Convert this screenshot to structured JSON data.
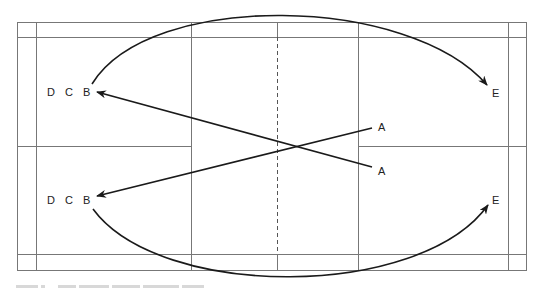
{
  "diagram": {
    "type": "badminton-court-rotation",
    "labels": {
      "top_left": [
        "D",
        "C",
        "B"
      ],
      "bottom_left": [
        "D",
        "C",
        "B"
      ],
      "right_upper": "A",
      "right_lower": "A",
      "top_right": "E",
      "bottom_right": "E"
    },
    "arrows": [
      {
        "from": "B (top-left)",
        "to": "E (top-right)",
        "shape": "curve-over-top"
      },
      {
        "from": "B (bottom-left)",
        "to": "E (bottom-right)",
        "shape": "curve-under-bottom"
      },
      {
        "from": "A (lower-right)",
        "to": "B (top-left)",
        "shape": "straight"
      },
      {
        "from": "A (upper-right)",
        "to": "B (bottom-left)",
        "shape": "straight"
      }
    ],
    "colors": {
      "court_line": "#777777",
      "arrow": "#1a1a1a",
      "label": "#222222"
    }
  },
  "caption": {
    "text_blurred": true
  }
}
